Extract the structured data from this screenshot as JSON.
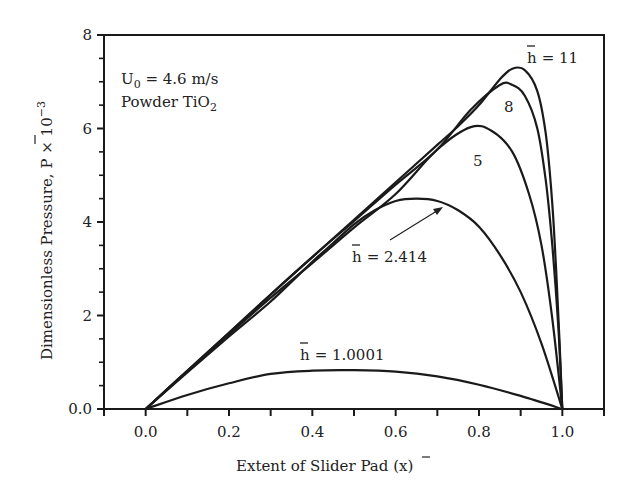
{
  "chart_data": {
    "type": "line",
    "title": "",
    "xlabel": "Extent of Slider Pad (x̄)",
    "ylabel": "Dimensionless Pressure, P̄ × 10⁻³",
    "xlim": [
      -0.1,
      1.1
    ],
    "ylim": [
      0,
      8
    ],
    "x_ticks": [
      0.0,
      0.2,
      0.4,
      0.6,
      0.8,
      1.0
    ],
    "x_tick_labels": [
      "0.0",
      "0.2",
      "0.4",
      "0.6",
      "0.8",
      "1.0"
    ],
    "x_minor_ticks": [
      -0.1,
      0.1,
      0.3,
      0.5,
      0.7,
      0.9,
      1.1
    ],
    "y_ticks": [
      0,
      2,
      4,
      6,
      8
    ],
    "y_tick_labels": [
      "0.0",
      "2",
      "4",
      "6",
      "8"
    ],
    "y_minor_ticks": [
      0.5,
      1,
      1.5,
      2.5,
      3,
      3.5,
      4.5,
      5,
      5.5,
      6.5,
      7,
      7.5
    ],
    "grid": false,
    "legend": "none (inline curve labels)",
    "annotations": [
      {
        "text": "U₀ = 4.6 m/s",
        "x": -0.04,
        "y": 7.0
      },
      {
        "text": "Powder TiO₂",
        "x": -0.04,
        "y": 6.5
      },
      {
        "text": "h̄ = 11",
        "x": 0.9,
        "y": 7.45
      },
      {
        "text": "8",
        "x": 0.86,
        "y": 6.4
      },
      {
        "text": "5",
        "x": 0.78,
        "y": 5.3
      },
      {
        "text": "h̄ = 2.414",
        "x": 0.5,
        "y": 3.2,
        "arrow_to": [
          0.72,
          4.35
        ]
      },
      {
        "text": "h̄ = 1.0001",
        "x": 0.38,
        "y": 1.0
      }
    ],
    "series": [
      {
        "name": "h̄ = 11",
        "x": [
          0,
          0.1,
          0.2,
          0.3,
          0.4,
          0.5,
          0.6,
          0.7,
          0.75,
          0.8,
          0.85,
          0.88,
          0.91,
          0.94,
          0.96,
          0.975,
          0.985,
          0.993,
          1.0
        ],
        "y": [
          0,
          0.82,
          1.63,
          2.45,
          3.25,
          4.05,
          4.85,
          5.65,
          6.05,
          6.5,
          7.05,
          7.28,
          7.25,
          6.8,
          5.9,
          4.5,
          3.0,
          1.5,
          0
        ]
      },
      {
        "name": "h̄ = 8",
        "x": [
          0,
          0.1,
          0.2,
          0.3,
          0.4,
          0.5,
          0.6,
          0.7,
          0.78,
          0.85,
          0.88,
          0.91,
          0.94,
          0.96,
          0.975,
          0.99,
          1.0
        ],
        "y": [
          0,
          0.82,
          1.63,
          2.45,
          3.25,
          4.02,
          4.8,
          5.55,
          6.4,
          6.93,
          6.93,
          6.7,
          6.0,
          4.9,
          3.6,
          1.8,
          0
        ]
      },
      {
        "name": "h̄ = 5",
        "x": [
          0,
          0.1,
          0.2,
          0.3,
          0.4,
          0.5,
          0.6,
          0.7,
          0.78,
          0.83,
          0.88,
          0.92,
          0.95,
          0.975,
          1.0
        ],
        "y": [
          0,
          0.8,
          1.6,
          2.38,
          3.12,
          3.88,
          4.6,
          5.55,
          6.03,
          5.95,
          5.5,
          4.6,
          3.5,
          2.0,
          0
        ]
      },
      {
        "name": "h̄ = 2.414",
        "x": [
          0,
          0.1,
          0.2,
          0.3,
          0.4,
          0.45,
          0.5,
          0.55,
          0.6,
          0.65,
          0.7,
          0.75,
          0.8,
          0.85,
          0.9,
          0.95,
          1.0
        ],
        "y": [
          0,
          0.78,
          1.55,
          2.3,
          3.15,
          3.55,
          3.95,
          4.25,
          4.45,
          4.5,
          4.45,
          4.25,
          3.9,
          3.3,
          2.5,
          1.4,
          0
        ]
      },
      {
        "name": "h̄ = 1.0001",
        "x": [
          0,
          0.1,
          0.2,
          0.3,
          0.4,
          0.5,
          0.6,
          0.7,
          0.8,
          0.9,
          1.0
        ],
        "y": [
          0,
          0.3,
          0.55,
          0.75,
          0.82,
          0.83,
          0.8,
          0.7,
          0.52,
          0.28,
          0
        ]
      }
    ]
  },
  "labels": {
    "u0_prefix": "U",
    "u0_sub": "0",
    "u0_rest": " = 4.6 m/s",
    "powder_prefix": "Powder TiO",
    "powder_sub": "2",
    "h11": "= 11",
    "h8": "8",
    "h5": "5",
    "h2414": "= 2.414",
    "h10001": "= 1.0001",
    "h_symbol": "h",
    "xlabel_main": "Extent of Slider Pad (",
    "xlabel_var": "x",
    "xlabel_close": ")",
    "ylabel_main": "Dimensionless Pressure, ",
    "ylabel_var": "P",
    "ylabel_times": " × 10",
    "ylabel_exp": "−3"
  }
}
